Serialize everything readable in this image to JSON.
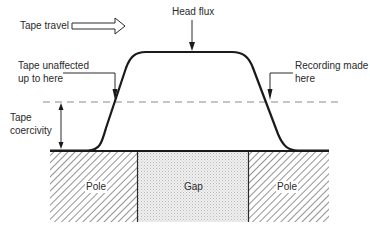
{
  "diagram": {
    "labels": {
      "tape_travel": "Tape travel",
      "head_flux": "Head flux",
      "tape_unaffected_line1": "Tape unaffected",
      "tape_unaffected_line2": "up to here",
      "recording_made_line1": "Recording made",
      "recording_made_line2": "here",
      "tape_coercivity_line1": "Tape",
      "tape_coercivity_line2": "coercivity",
      "left_pole": "Pole",
      "gap": "Gap",
      "right_pole": "Pole"
    },
    "colors": {
      "line": "#1a1a1a",
      "dashed": "#8a8a8a",
      "hatch": "#3a3a3a",
      "gap_fill": "#e4e4e4",
      "background": "#ffffff"
    }
  }
}
